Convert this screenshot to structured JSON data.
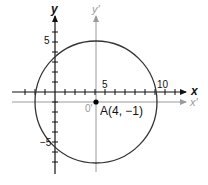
{
  "diagram": {
    "type": "coordinate-translation",
    "axes": {
      "x_label": "x",
      "y_label": "y",
      "x_prime_label": "x'",
      "y_prime_label": "y'",
      "origin_prime_label": "0'"
    },
    "ticks": {
      "x_label_5": "5",
      "x_label_10": "10",
      "y_label_5": "5",
      "y_label_neg5": "−5"
    },
    "point": {
      "label": "A(4, −1)",
      "x": 4,
      "y": -1
    },
    "circle": {
      "center": [
        4,
        -1
      ],
      "radius_units": 6.1
    },
    "colors": {
      "main_axes": "#111111",
      "prime_axes": "#9a9a9a",
      "circle": "#333333"
    }
  }
}
